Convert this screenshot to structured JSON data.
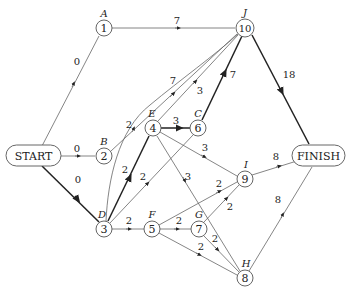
{
  "diagram": {
    "type": "activity-network",
    "terminals": [
      {
        "id": "start",
        "label": "START"
      },
      {
        "id": "finish",
        "label": "FINISH"
      }
    ],
    "nodes": [
      {
        "id": "n1",
        "number": "1",
        "letter": "A"
      },
      {
        "id": "n2",
        "number": "2",
        "letter": "B"
      },
      {
        "id": "n3",
        "number": "3",
        "letter": "D"
      },
      {
        "id": "n4",
        "number": "4",
        "letter": "E"
      },
      {
        "id": "n5",
        "number": "5",
        "letter": "F"
      },
      {
        "id": "n6",
        "number": "6",
        "letter": "C"
      },
      {
        "id": "n7",
        "number": "7",
        "letter": "G"
      },
      {
        "id": "n8",
        "number": "8",
        "letter": "H"
      },
      {
        "id": "n9",
        "number": "9",
        "letter": "I"
      },
      {
        "id": "n10",
        "number": "10",
        "letter": "J"
      }
    ],
    "edges": [
      {
        "from": "START",
        "to": "A",
        "weight": "0",
        "critical": false
      },
      {
        "from": "START",
        "to": "B",
        "weight": "0",
        "critical": false
      },
      {
        "from": "START",
        "to": "D",
        "weight": "0",
        "critical": true
      },
      {
        "from": "A",
        "to": "J",
        "weight": "7",
        "critical": false
      },
      {
        "from": "B",
        "to": "J",
        "weight": "7",
        "critical": false
      },
      {
        "from": "D",
        "to": "J",
        "weight": "2",
        "critical": false
      },
      {
        "from": "E",
        "to": "J",
        "weight": "3",
        "critical": false
      },
      {
        "from": "C",
        "to": "J",
        "weight": "7",
        "critical": true
      },
      {
        "from": "J",
        "to": "FINISH",
        "weight": "18",
        "critical": true
      },
      {
        "from": "D",
        "to": "E",
        "weight": "2",
        "critical": true
      },
      {
        "from": "E",
        "to": "C",
        "weight": "3",
        "critical": true
      },
      {
        "from": "D",
        "to": "C",
        "weight": "2",
        "critical": false
      },
      {
        "from": "E",
        "to": "I",
        "weight": "3",
        "critical": false
      },
      {
        "from": "E",
        "to": "H",
        "weight": "3",
        "critical": false
      },
      {
        "from": "D",
        "to": "F",
        "weight": "2",
        "critical": false
      },
      {
        "from": "F",
        "to": "G",
        "weight": "2",
        "critical": false
      },
      {
        "from": "F",
        "to": "I",
        "weight": "2",
        "critical": false
      },
      {
        "from": "F",
        "to": "H",
        "weight": "2",
        "critical": false
      },
      {
        "from": "G",
        "to": "I",
        "weight": "2",
        "critical": false
      },
      {
        "from": "G",
        "to": "H",
        "weight": "2",
        "critical": false
      },
      {
        "from": "I",
        "to": "FINISH",
        "weight": "8",
        "critical": false
      },
      {
        "from": "H",
        "to": "FINISH",
        "weight": "8",
        "critical": false
      }
    ]
  }
}
